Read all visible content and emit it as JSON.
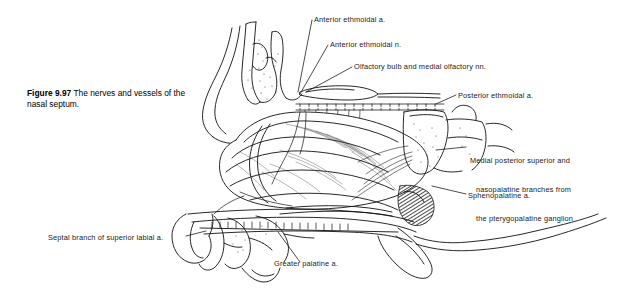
{
  "figure": {
    "number": "Figure 9.97",
    "caption_text": "The nerves and vessels of the nasal septum.",
    "line_color": "#111111",
    "background_color": "#ffffff"
  },
  "labels": {
    "anterior_ethmoidal_a": "Anterior ethmoidal a.",
    "anterior_ethmoidal_n": "Anterior ethmoidal n.",
    "olfactory": "Olfactory bulb and medial olfactory nn.",
    "posterior_ethmoidal_a": "Posterior ethmoidal a.",
    "medial_posterior_line1": "Medial posterior superior and",
    "medial_posterior_line2": "nasopalatine branches from",
    "medial_posterior_line3": "the pterygopalatine ganglion",
    "sphenopalatine_a": "Sphenopalatine a.",
    "septal_branch": "Septal branch of superior labial a.",
    "greater_palatine_a": "Greater palatine a."
  }
}
